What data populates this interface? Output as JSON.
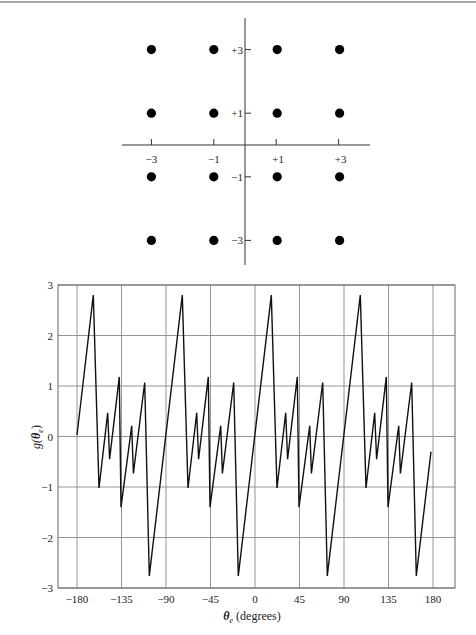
{
  "chart_data": [
    {
      "type": "scatter",
      "title": "",
      "description": "16-point signal constellation (16-QAM)",
      "x_ticks": [
        "-3",
        "-1",
        "+1",
        "+3"
      ],
      "y_ticks": [
        "+3",
        "+1",
        "-1",
        "-3"
      ],
      "levels": [
        -3,
        -1,
        1,
        3
      ],
      "points": [
        [
          -3,
          3
        ],
        [
          -1,
          3
        ],
        [
          1,
          3
        ],
        [
          3,
          3
        ],
        [
          -3,
          1
        ],
        [
          -1,
          1
        ],
        [
          1,
          1
        ],
        [
          3,
          1
        ],
        [
          -3,
          -1
        ],
        [
          -1,
          -1
        ],
        [
          1,
          -1
        ],
        [
          3,
          -1
        ],
        [
          -3,
          -3
        ],
        [
          -1,
          -3
        ],
        [
          1,
          -3
        ],
        [
          3,
          -3
        ]
      ],
      "xlabel": "",
      "ylabel": "",
      "grid": false
    },
    {
      "type": "line",
      "title": "",
      "xlabel": "θe (degrees)",
      "xlabel_main": "θ",
      "xlabel_sub": "e",
      "xlabel_rest": " (degrees)",
      "ylabel": "g(θe)",
      "ylabel_main": "g(",
      "ylabel_theta": "θ",
      "ylabel_sub": "e",
      "ylabel_close": ")",
      "xlim": [
        -180,
        180
      ],
      "ylim": [
        -3,
        3
      ],
      "x_ticks": [
        -180,
        -135,
        -90,
        -45,
        0,
        45,
        90,
        135,
        180
      ],
      "y_ticks": [
        3,
        2,
        1,
        0,
        -1,
        -2,
        -3
      ],
      "y_tick_labels": [
        "3",
        "2",
        "1",
        "0",
        "−1",
        "−2",
        "−3"
      ],
      "x_tick_labels": [
        "−180",
        "−135",
        "−90",
        "−45",
        "0",
        "45",
        "90",
        "135",
        "180"
      ],
      "grid": true,
      "series": [
        {
          "name": "g(θe)",
          "color": "#111111",
          "period_deg": 90,
          "x": [
            -180,
            -163.5,
            -157.8,
            -149,
            -147,
            -137.2,
            -135.5,
            -124.7,
            -123,
            -111.5,
            -106.9,
            -73.5,
            -67.8,
            -59,
            -57,
            -47.2,
            -45.5,
            -34.7,
            -33,
            -21.5,
            -16.9,
            16.5,
            22.2,
            31,
            33,
            42.8,
            44.5,
            55.3,
            57,
            68.5,
            73.1,
            106.5,
            112.2,
            121,
            123,
            132.8,
            134.5,
            145.3,
            147,
            158.5,
            163.1,
            178
          ],
          "y": [
            0.03,
            2.8,
            -1.02,
            0.47,
            -0.45,
            1.18,
            -1.4,
            0.21,
            -0.73,
            1.07,
            -2.76,
            2.8,
            -1.02,
            0.47,
            -0.45,
            1.18,
            -1.4,
            0.21,
            -0.73,
            1.07,
            -2.76,
            2.8,
            -1.02,
            0.47,
            -0.45,
            1.18,
            -1.4,
            0.21,
            -0.73,
            1.07,
            -2.76,
            2.8,
            -1.02,
            0.47,
            -0.45,
            1.18,
            -1.4,
            0.21,
            -0.73,
            1.07,
            -2.76,
            -0.3
          ]
        }
      ]
    }
  ]
}
